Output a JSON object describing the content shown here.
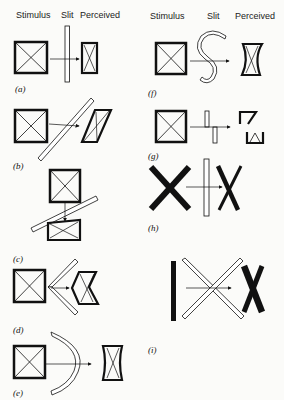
{
  "headers": {
    "left": {
      "stimulus": "Stimulus",
      "slit": "Slit",
      "perceived": "Perceived"
    },
    "right": {
      "stimulus": "Stimulus",
      "slit": "Slit",
      "perceived": "Perceived"
    }
  },
  "panels": [
    {
      "id": "a",
      "label": "(a)",
      "slit": "vertical straight slit",
      "perceived": "compressed rectangle with X"
    },
    {
      "id": "b",
      "label": "(b)",
      "slit": "diagonal straight slit",
      "perceived": "slanted parallelogram with diagonal"
    },
    {
      "id": "c",
      "label": "(c)",
      "slit": "shallow diagonal slit, vertical motion",
      "perceived": "flattened rectangle with X"
    },
    {
      "id": "d",
      "label": "(d)",
      "slit": "chevron (V-shaped) slit",
      "perceived": "chevron-shaped figure"
    },
    {
      "id": "e",
      "label": "(e)",
      "slit": "curved arc slit",
      "perceived": "concave-sided figure"
    },
    {
      "id": "f",
      "label": "(f)",
      "slit": "S-shaped slit",
      "perceived": "twisted figure"
    },
    {
      "id": "g",
      "label": "(g)",
      "slit": "two offset slit segments",
      "perceived": "split fragments"
    },
    {
      "id": "h",
      "label": "(h)",
      "slit": "vertical slit over letter X",
      "perceived": "narrowed X"
    },
    {
      "id": "i",
      "label": "(i)",
      "slit": "crossed diagonal slits over a bar",
      "perceived": "letter X"
    }
  ]
}
